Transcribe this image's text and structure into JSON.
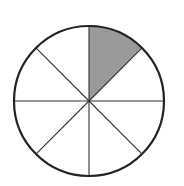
{
  "diagram": {
    "type": "fraction-circle",
    "total_parts": 8,
    "shaded_parts": 1,
    "shaded_sector_index": 0,
    "center": [
      89,
      101
    ],
    "radius": 75,
    "colors": {
      "outline": "#222222",
      "divider": "#333333",
      "shaded": "#9a9a9a",
      "unshaded": "#ffffff",
      "background": "#ffffff"
    }
  }
}
